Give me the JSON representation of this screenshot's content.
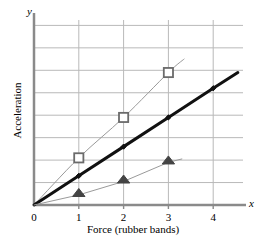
{
  "chart_data": {
    "type": "line",
    "title": "",
    "xlabel": "Force (rubber bands)",
    "ylabel": "Acceleration",
    "x_axis_letter": "x",
    "y_axis_letter": "y",
    "xticks": [
      0,
      1,
      2,
      3,
      4
    ],
    "xtick_labels": [
      "0",
      "1",
      "2",
      "3",
      "4"
    ],
    "yticks": [
      1,
      2,
      3,
      4,
      5,
      6,
      7,
      8
    ],
    "ytick_labels": [
      "",
      "",
      "",
      "",
      "",
      "",
      "",
      ""
    ],
    "xlim": [
      0,
      4.8
    ],
    "ylim": [
      0,
      8.5
    ],
    "grid": true,
    "grid_color": "#b9b9b9",
    "legend": "none",
    "axis_color": "#8a8a8a",
    "series": [
      {
        "name": "squares",
        "marker": "square",
        "marker_color": "#6b6b6b",
        "line_color": "#9a9a9a",
        "line_width": 1,
        "smooth": true,
        "x": [
          0,
          1,
          2,
          3
        ],
        "y": [
          0,
          2.1,
          3.9,
          5.9
        ],
        "extra_x": [
          3.35
        ],
        "extra_y": [
          6.5
        ]
      },
      {
        "name": "diamonds",
        "marker": "diamond",
        "marker_color": "#111111",
        "line_color": "#111111",
        "line_width": 3,
        "smooth": false,
        "x": [
          0,
          1,
          2,
          3,
          4
        ],
        "y": [
          0,
          1.3,
          2.6,
          3.9,
          5.2
        ],
        "extra_x": [
          4.55
        ],
        "extra_y": [
          5.9
        ]
      },
      {
        "name": "triangles",
        "marker": "triangle",
        "marker_color": "#444444",
        "line_color": "#9a9a9a",
        "line_width": 1,
        "smooth": false,
        "x": [
          0,
          1,
          2,
          3
        ],
        "y": [
          0,
          0.45,
          1.05,
          1.9
        ],
        "extra_x": [
          3.3
        ],
        "extra_y": [
          2.05
        ]
      }
    ]
  }
}
